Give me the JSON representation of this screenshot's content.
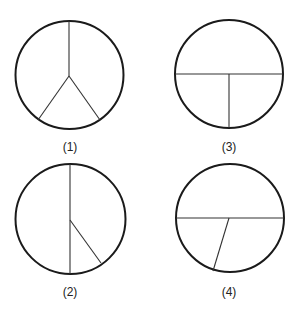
{
  "diagrams": [
    {
      "id": 1,
      "label": "(1)",
      "circle": {
        "cx": 69.5,
        "cy": 75,
        "r": 54
      },
      "segments": [
        {
          "x1": 69,
          "y1": 21,
          "x2": 69,
          "y2": 76
        },
        {
          "x1": 69,
          "y1": 76,
          "x2": 38,
          "y2": 120
        },
        {
          "x1": 69,
          "y1": 76,
          "x2": 100,
          "y2": 120
        }
      ],
      "label_pos": {
        "x": 70,
        "y": 140
      }
    },
    {
      "id": 3,
      "label": "(3)",
      "circle": {
        "cx": 229,
        "cy": 74,
        "r": 54
      },
      "segments": [
        {
          "x1": 175,
          "y1": 74,
          "x2": 283,
          "y2": 74
        },
        {
          "x1": 229,
          "y1": 74,
          "x2": 229,
          "y2": 128
        }
      ],
      "label_pos": {
        "x": 229,
        "y": 140
      }
    },
    {
      "id": 2,
      "label": "(2)",
      "circle": {
        "cx": 70.5,
        "cy": 219,
        "r": 55
      },
      "segments": [
        {
          "x1": 70,
          "y1": 164,
          "x2": 70,
          "y2": 274
        },
        {
          "x1": 70,
          "y1": 220,
          "x2": 101,
          "y2": 263
        }
      ],
      "label_pos": {
        "x": 70,
        "y": 285
      }
    },
    {
      "id": 4,
      "label": "(4)",
      "circle": {
        "cx": 230,
        "cy": 218,
        "r": 54
      },
      "segments": [
        {
          "x1": 176,
          "y1": 218,
          "x2": 284,
          "y2": 218
        },
        {
          "x1": 229,
          "y1": 218,
          "x2": 213,
          "y2": 271
        }
      ],
      "label_pos": {
        "x": 229,
        "y": 285
      }
    }
  ]
}
